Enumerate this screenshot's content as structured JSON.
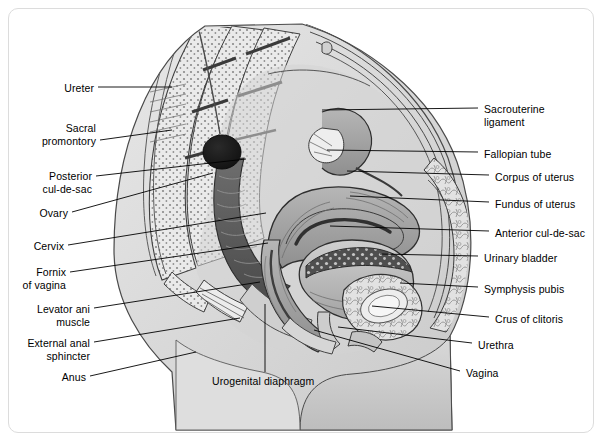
{
  "figure": {
    "style": "grayscale medical line illustration",
    "frame_color": "#dcdcdc",
    "background_color": "#ffffff",
    "line_color": "#000000"
  },
  "labels_left": [
    {
      "name": "ureter",
      "text": "Ureter",
      "x": 60,
      "y": 82,
      "line": [
        [
          98,
          87
        ],
        [
          172,
          87
        ]
      ]
    },
    {
      "name": "sacral-promontory",
      "text": "Sacral\npromontory",
      "x": 19,
      "y": 122,
      "line": [
        [
          100,
          140
        ],
        [
          172,
          130
        ]
      ]
    },
    {
      "name": "posterior-cul-de-sac",
      "text": "Posterior\ncul-de-sac",
      "x": 26,
      "y": 170,
      "line": [
        [
          96,
          176
        ],
        [
          246,
          159
        ]
      ]
    },
    {
      "name": "ovary",
      "text": "Ovary",
      "x": 24,
      "y": 207,
      "line": [
        [
          72,
          212
        ],
        [
          213,
          173
        ]
      ]
    },
    {
      "name": "cervix",
      "text": "Cervix",
      "x": 14,
      "y": 240,
      "line": [
        [
          68,
          245
        ],
        [
          266,
          213
        ]
      ]
    },
    {
      "name": "fornix-of-vagina",
      "text": "Fornix\nof vagina",
      "x": 16,
      "y": 266,
      "line": [
        [
          70,
          272
        ],
        [
          268,
          243
        ]
      ]
    },
    {
      "name": "levator-ani-muscle",
      "text": "Levator ani\nmuscle",
      "x": 16,
      "y": 303,
      "line": [
        [
          94,
          308
        ],
        [
          260,
          282
        ]
      ]
    },
    {
      "name": "external-anal-sphincter",
      "text": "External anal\nsphincter",
      "x": 12,
      "y": 337,
      "line": [
        [
          94,
          342
        ],
        [
          240,
          318
        ]
      ]
    },
    {
      "name": "anus",
      "text": "Anus",
      "x": 56,
      "y": 371,
      "line": [
        [
          90,
          376
        ],
        [
          196,
          352
        ]
      ]
    }
  ],
  "labels_right": [
    {
      "name": "sacrouterine-ligament",
      "text": "Sacrouterine\nligament",
      "x": 484,
      "y": 103,
      "line": [
        [
          478,
          108
        ],
        [
          322,
          110
        ]
      ]
    },
    {
      "name": "fallopian-tube",
      "text": "Fallopian tube",
      "x": 484,
      "y": 148,
      "line": [
        [
          478,
          152
        ],
        [
          327,
          150
        ]
      ]
    },
    {
      "name": "corpus-of-uterus",
      "text": "Corpus of uterus",
      "x": 495,
      "y": 171,
      "line": [
        [
          489,
          175
        ],
        [
          347,
          171
        ]
      ]
    },
    {
      "name": "fundus-of-uterus",
      "text": "Fundus of uterus",
      "x": 495,
      "y": 198,
      "line": [
        [
          489,
          202
        ],
        [
          350,
          196
        ]
      ]
    },
    {
      "name": "anterior-cul-de-sac",
      "text": "Anterior cul-de-sac",
      "x": 495,
      "y": 227,
      "line": [
        [
          489,
          231
        ],
        [
          330,
          226
        ]
      ]
    },
    {
      "name": "urinary-bladder",
      "text": "Urinary bladder",
      "x": 484,
      "y": 252,
      "line": [
        [
          478,
          256
        ],
        [
          380,
          254
        ]
      ]
    },
    {
      "name": "symphysis-pubis",
      "text": "Symphysis pubis",
      "x": 484,
      "y": 283,
      "line": [
        [
          478,
          287
        ],
        [
          400,
          283
        ]
      ]
    },
    {
      "name": "crus-of-clitoris",
      "text": "Crus of clitoris",
      "x": 495,
      "y": 313,
      "line": [
        [
          489,
          317
        ],
        [
          372,
          306
        ]
      ]
    },
    {
      "name": "urethra",
      "text": "Urethra",
      "x": 478,
      "y": 339,
      "line": [
        [
          472,
          343
        ],
        [
          338,
          327
        ]
      ]
    },
    {
      "name": "vagina",
      "text": "Vagina",
      "x": 466,
      "y": 367,
      "line": [
        [
          460,
          371
        ],
        [
          314,
          330
        ]
      ]
    }
  ],
  "labels_bottom": [
    {
      "name": "urogenital-diaphragm",
      "text": "Urogenital diaphragm",
      "x": 212,
      "y": 375,
      "line": [
        [
          265,
          372
        ],
        [
          265,
          304
        ]
      ]
    }
  ],
  "anatomy_parts": [
    "sacrum-vertebrae",
    "coccyx",
    "rectum",
    "anus",
    "ovary",
    "fallopian-tube",
    "uterus-corpus",
    "uterus-fundus",
    "cervix",
    "vagina",
    "urinary-bladder",
    "urethra",
    "symphysis-pubis",
    "abdominal-wall",
    "levator-ani",
    "body-outline"
  ]
}
